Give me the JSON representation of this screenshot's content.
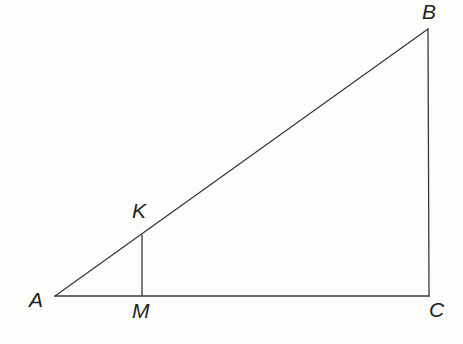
{
  "figure": {
    "kind": "geometry-diagram",
    "width": 463,
    "height": 344,
    "background_color": "#fdfdfc",
    "stroke_color": "#3a3a3a",
    "stroke_width": 1.3,
    "label_color": "#222222",
    "points": [
      {
        "id": "A",
        "label": "A",
        "x": 55,
        "y": 296,
        "label_x": 29,
        "label_y": 289,
        "role": "triangle-vertex"
      },
      {
        "id": "B",
        "label": "B",
        "x": 428,
        "y": 29,
        "label_x": 422,
        "label_y": 1,
        "role": "triangle-vertex"
      },
      {
        "id": "C",
        "label": "C",
        "x": 429,
        "y": 296,
        "label_x": 429,
        "label_y": 299,
        "role": "triangle-vertex-right-angle"
      },
      {
        "id": "K",
        "label": "K",
        "x": 142,
        "y": 235,
        "label_x": 132,
        "label_y": 200,
        "role": "point-on-hypotenuse"
      },
      {
        "id": "M",
        "label": "M",
        "x": 142,
        "y": 296,
        "label_x": 132,
        "label_y": 300,
        "role": "foot-of-perpendicular-on-base"
      }
    ],
    "segments": [
      {
        "id": "AB",
        "from": "A",
        "to": "B",
        "x1": 55,
        "y1": 296,
        "x2": 428,
        "y2": 29,
        "name": "hypotenuse"
      },
      {
        "id": "BC",
        "from": "B",
        "to": "C",
        "x1": 428,
        "y1": 29,
        "x2": 429,
        "y2": 296,
        "name": "vertical-leg"
      },
      {
        "id": "AC",
        "from": "A",
        "to": "C",
        "x1": 55,
        "y1": 296,
        "x2": 429,
        "y2": 296,
        "name": "horizontal-base"
      },
      {
        "id": "KM",
        "from": "K",
        "to": "M",
        "x1": 142,
        "y1": 235,
        "x2": 142,
        "y2": 296,
        "name": "perpendicular-segment"
      }
    ]
  }
}
